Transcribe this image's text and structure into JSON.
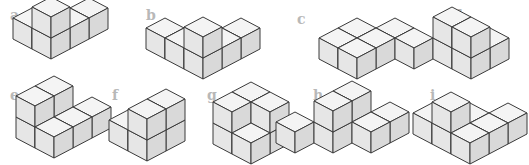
{
  "colors": {
    "background": "#ffffff",
    "label": "#b8b8b8",
    "edge": "#3a3a3a",
    "top_face": "#f4f4f4",
    "left_face": "#e6e6e6",
    "right_face": "#d9d9d9"
  },
  "cube": {
    "w": 19,
    "h": 10,
    "s": 21
  },
  "figures": [
    {
      "label": "a",
      "label_x": 10,
      "label_y": 8,
      "ox": 51,
      "oy": 38,
      "cubes": [
        [
          -1,
          0,
          0
        ],
        [
          0,
          -2,
          0
        ],
        [
          0,
          -1,
          0
        ],
        [
          0,
          0,
          0
        ],
        [
          0,
          0,
          1
        ]
      ]
    },
    {
      "label": "b",
      "label_x": 146,
      "label_y": 8,
      "ox": 203,
      "oy": 58,
      "cubes": [
        [
          -2,
          0,
          0
        ],
        [
          -1,
          0,
          0
        ],
        [
          0,
          -2,
          0
        ],
        [
          0,
          -1,
          0
        ],
        [
          0,
          0,
          0
        ],
        [
          0,
          0,
          1
        ]
      ]
    },
    {
      "label": "c",
      "label_x": 297,
      "label_y": 12,
      "ox": 357,
      "oy": 58,
      "cubes": [
        [
          -1,
          -1,
          0
        ],
        [
          0,
          -2,
          0
        ],
        [
          -1,
          0,
          0
        ],
        [
          0,
          -1,
          0
        ],
        [
          0,
          0,
          0
        ],
        [
          1,
          -2,
          0
        ]
      ]
    },
    {
      "label": "d",
      "label_x": 453,
      "label_y": 8,
      "ox": 471,
      "oy": 58,
      "cubes": [
        [
          0,
          -1,
          0
        ],
        [
          -1,
          0,
          0
        ],
        [
          -1,
          0,
          1
        ],
        [
          0,
          0,
          0
        ],
        [
          0,
          0,
          1
        ]
      ]
    },
    {
      "label": "e",
      "label_x": 10,
      "label_y": 88,
      "ox": 54,
      "oy": 137,
      "cubes": [
        [
          -1,
          -1,
          0
        ],
        [
          0,
          -2,
          0
        ],
        [
          -1,
          0,
          0
        ],
        [
          0,
          -1,
          0
        ],
        [
          -1,
          0,
          1
        ],
        [
          -1,
          -1,
          1
        ],
        [
          0,
          0,
          0
        ]
      ]
    },
    {
      "label": "f",
      "label_x": 112,
      "label_y": 88,
      "ox": 147,
      "oy": 140,
      "cubes": [
        [
          -1,
          -1,
          0
        ],
        [
          0,
          -1,
          0
        ],
        [
          0,
          -1,
          1
        ],
        [
          -1,
          0,
          0
        ],
        [
          0,
          0,
          0
        ],
        [
          0,
          0,
          1
        ]
      ]
    },
    {
      "label": "g",
      "label_x": 207,
      "label_y": 88,
      "ox": 251,
      "oy": 143,
      "cubes": [
        [
          -1,
          -1,
          0
        ],
        [
          -1,
          -1,
          1
        ],
        [
          0,
          -1,
          0
        ],
        [
          0,
          -1,
          1
        ],
        [
          -1,
          0,
          0
        ],
        [
          -1,
          0,
          1
        ],
        [
          0,
          0,
          0
        ]
      ]
    },
    {
      "label": "h",
      "label_x": 313,
      "label_y": 88,
      "ox": 352,
      "oy": 142,
      "cubes": [
        [
          0,
          -1,
          0
        ],
        [
          -1,
          0,
          0
        ],
        [
          -1,
          0,
          1
        ],
        [
          -1,
          -1,
          0
        ],
        [
          -1,
          -1,
          1
        ],
        [
          0,
          -2,
          0
        ],
        [
          -2,
          1,
          0
        ]
      ]
    },
    {
      "label": "i",
      "label_x": 430,
      "label_y": 88,
      "ox": 470,
      "oy": 143,
      "cubes": [
        [
          -2,
          0,
          0
        ],
        [
          -1,
          -1,
          0
        ],
        [
          -1,
          0,
          0
        ],
        [
          -1,
          0,
          1
        ],
        [
          0,
          -2,
          0
        ],
        [
          0,
          -1,
          0
        ],
        [
          0,
          0,
          0
        ]
      ]
    }
  ]
}
